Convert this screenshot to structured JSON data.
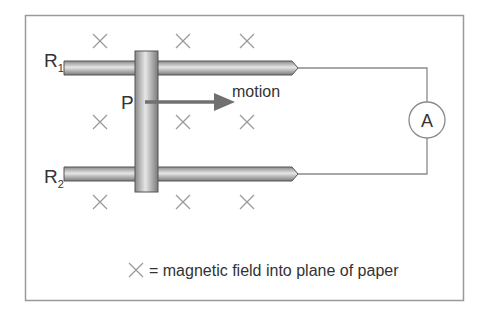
{
  "diagram": {
    "rail_labels": {
      "r1_main": "R",
      "r1_sub": "1",
      "r2_main": "R",
      "r2_sub": "2"
    },
    "bar_label": "P",
    "motion_label": "motion",
    "meter_label": "A",
    "legend_text": "= magnetic field into plane of paper",
    "colors": {
      "frame": "#9a9a9a",
      "rod_dark": "#6f6f6f",
      "rod_light": "#e0e0e0",
      "cross": "#9a9a9a",
      "arrow": "#707070",
      "wire": "#8a8a8a"
    }
  }
}
